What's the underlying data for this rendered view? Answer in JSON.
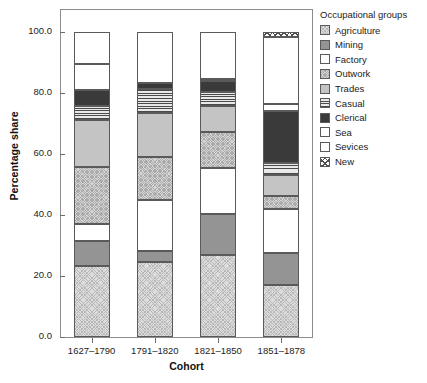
{
  "chart_data": {
    "type": "bar",
    "stacked": true,
    "title": "",
    "xlabel": "Cohort",
    "ylabel": "Percentage share",
    "legend_title": "Occupational groups",
    "legend_position": "right",
    "grid": false,
    "ylim": [
      0.0,
      100.0
    ],
    "yticks": [
      "0.0",
      "20.0",
      "40.0",
      "60.0",
      "80.0",
      "100.0"
    ],
    "ytick_values": [
      0.0,
      20.0,
      40.0,
      60.0,
      80.0,
      100.0
    ],
    "categories": [
      "1627–1790",
      "1791–1820",
      "1821–1850",
      "1851–1878"
    ],
    "series": [
      {
        "name": "Agriculture",
        "pattern": "fine-crosshatch-light",
        "values": [
          23.3,
          24.6,
          27.0,
          17.0
        ]
      },
      {
        "name": "Mining",
        "pattern": "solid-grey",
        "values": [
          8.2,
          3.6,
          13.3,
          10.5
        ]
      },
      {
        "name": "Factory",
        "pattern": "white-speckle",
        "values": [
          5.5,
          16.8,
          15.2,
          14.5
        ]
      },
      {
        "name": "Outwork",
        "pattern": "stipple-light",
        "values": [
          18.7,
          14.1,
          11.6,
          4.3
        ]
      },
      {
        "name": "Trades",
        "pattern": "plain-mid-grey",
        "values": [
          15.4,
          14.4,
          8.6,
          6.8
        ]
      },
      {
        "name": "Casual",
        "pattern": "horizontal-lines",
        "values": [
          4.6,
          7.9,
          4.5,
          3.9
        ]
      },
      {
        "name": "Clerical",
        "pattern": "solid-dark",
        "values": [
          5.2,
          1.8,
          3.6,
          17.0
        ]
      },
      {
        "name": "Sea",
        "pattern": "white",
        "values": [
          8.5,
          0.0,
          0.9,
          2.3
        ]
      },
      {
        "name": "Sevices",
        "pattern": "very-light-grey",
        "values": [
          10.6,
          16.8,
          15.3,
          22.2
        ]
      },
      {
        "name": "New",
        "pattern": "bold-crosshatch",
        "values": [
          0.0,
          0.0,
          0.0,
          1.5
        ]
      }
    ]
  },
  "axes": {
    "y_label": "Percentage share",
    "x_label": "Cohort"
  },
  "legend": {
    "title": "Occupational groups",
    "items": [
      {
        "label": "Agriculture"
      },
      {
        "label": "Mining"
      },
      {
        "label": "Factory"
      },
      {
        "label": "Outwork"
      },
      {
        "label": "Trades"
      },
      {
        "label": "Casual"
      },
      {
        "label": "Clerical"
      },
      {
        "label": "Sea"
      },
      {
        "label": "Sevices"
      },
      {
        "label": "New"
      }
    ]
  }
}
